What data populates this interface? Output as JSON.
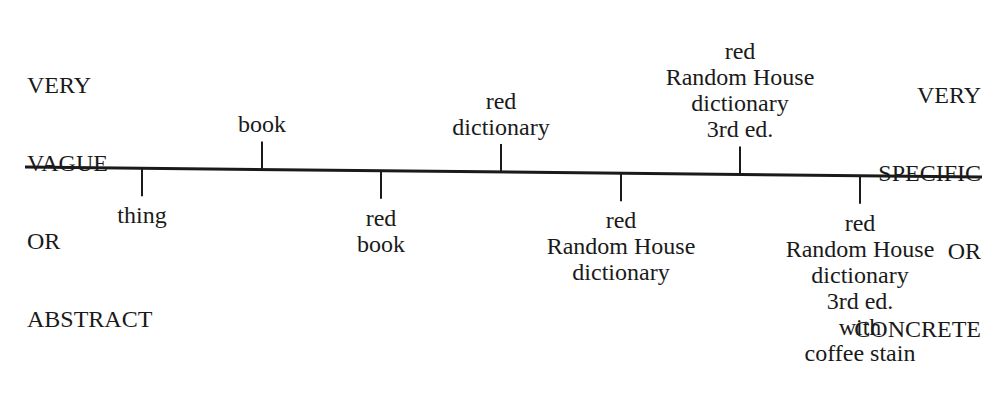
{
  "diagram": {
    "left_end_label": [
      "VERY",
      "VAGUE",
      "OR",
      "ABSTRACT"
    ],
    "right_end_label": [
      "VERY",
      "SPECIFIC",
      "OR",
      "CONCRETE"
    ],
    "axis": {
      "x1": 25,
      "y1": 167,
      "x2": 982,
      "y2": 177,
      "stroke": "#1a1a1a",
      "width": 3
    },
    "ticks": [
      {
        "x": 142,
        "side": "below",
        "lines": [
          "thing"
        ]
      },
      {
        "x": 262,
        "side": "above",
        "lines": [
          "book"
        ]
      },
      {
        "x": 381,
        "side": "below",
        "lines": [
          "red",
          "book"
        ]
      },
      {
        "x": 501,
        "side": "above",
        "lines": [
          "red",
          "dictionary"
        ]
      },
      {
        "x": 621,
        "side": "below",
        "lines": [
          "red",
          "Random House",
          "dictionary"
        ]
      },
      {
        "x": 740,
        "side": "above",
        "lines": [
          "red",
          "Random House",
          "dictionary",
          "3rd ed."
        ]
      },
      {
        "x": 860,
        "side": "below",
        "lines": [
          "red",
          "Random House",
          "dictionary",
          "3rd ed.",
          "with",
          "coffee stain"
        ]
      }
    ]
  }
}
